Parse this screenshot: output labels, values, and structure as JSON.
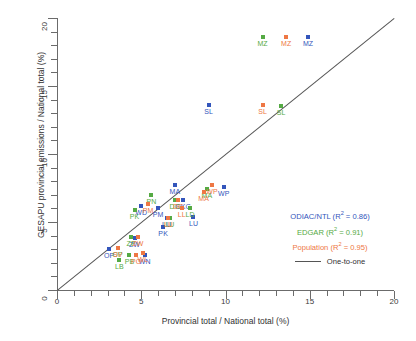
{
  "chart_data": {
    "type": "scatter",
    "title": "",
    "xlabel": "Provincial total / National total (%)",
    "ylabel": "GESAPU provincial emissions / National total (%)",
    "xlim": [
      0,
      20
    ],
    "ylim": [
      0,
      20
    ],
    "xticks_major": [
      0,
      5,
      10,
      15,
      20
    ],
    "yticks_major": [
      0,
      5,
      10,
      15,
      20
    ],
    "xtick_step": 1,
    "ytick_step": 1,
    "grid": false,
    "legend_position": "inside-lower-right",
    "colors": {
      "odiac": "#3355bb",
      "edgar": "#55aa44",
      "population": "#ee7744",
      "one_to_one": "#555555",
      "axis": "#6b6b6b"
    },
    "series": [
      {
        "name": "ODIAC/NTL",
        "color": "#3355bb",
        "r2": "0.86",
        "legend_label": "ODIAC/NTL (R",
        "points": [
          {
            "label": "MZ",
            "x": 14.9,
            "y": 18.6
          },
          {
            "label": "SL",
            "x": 9.0,
            "y": 13.6
          },
          {
            "label": "WP",
            "x": 9.9,
            "y": 7.6
          },
          {
            "label": "MA",
            "x": 7.0,
            "y": 7.7
          },
          {
            "label": "DKG",
            "x": 7.5,
            "y": 6.6
          },
          {
            "label": "LU",
            "x": 8.1,
            "y": 5.4
          },
          {
            "label": "PM",
            "x": 6.0,
            "y": 6.0
          },
          {
            "label": "LU",
            "x": 6.5,
            "y": 5.3
          },
          {
            "label": "PK",
            "x": 6.3,
            "y": 4.6
          },
          {
            "label": "WD",
            "x": 5.0,
            "y": 6.2
          },
          {
            "label": "ZW",
            "x": 4.6,
            "y": 3.8
          },
          {
            "label": "WN",
            "x": 5.2,
            "y": 2.6
          },
          {
            "label": "OP",
            "x": 3.1,
            "y": 3.0
          }
        ]
      },
      {
        "name": "EDGAR",
        "color": "#55aa44",
        "r2": "0.91",
        "legend_label": "EDGAR (R",
        "points": [
          {
            "label": "MZ",
            "x": 12.2,
            "y": 18.6
          },
          {
            "label": "SL",
            "x": 13.3,
            "y": 13.5
          },
          {
            "label": "MA",
            "x": 8.9,
            "y": 7.4
          },
          {
            "label": "DG",
            "x": 7.0,
            "y": 6.6
          },
          {
            "label": "LD",
            "x": 7.9,
            "y": 6.0
          },
          {
            "label": "PN",
            "x": 5.6,
            "y": 7.0
          },
          {
            "label": "PK",
            "x": 4.6,
            "y": 5.9
          },
          {
            "label": "LU",
            "x": 6.7,
            "y": 5.3
          },
          {
            "label": "ZP",
            "x": 4.4,
            "y": 3.9
          },
          {
            "label": "OP",
            "x": 3.6,
            "y": 3.1
          },
          {
            "label": "PB",
            "x": 4.3,
            "y": 2.6
          },
          {
            "label": "LB",
            "x": 3.7,
            "y": 2.2
          }
        ]
      },
      {
        "name": "Population",
        "color": "#ee7744",
        "r2": "0.95",
        "legend_label": "Population (R",
        "points": [
          {
            "label": "MZ",
            "x": 13.6,
            "y": 18.6
          },
          {
            "label": "SL",
            "x": 12.2,
            "y": 13.6
          },
          {
            "label": "WP",
            "x": 9.2,
            "y": 7.7
          },
          {
            "label": "MA",
            "x": 8.7,
            "y": 7.2
          },
          {
            "label": "DG",
            "x": 7.2,
            "y": 6.6
          },
          {
            "label": "LL",
            "x": 7.4,
            "y": 6.0
          },
          {
            "label": "LU",
            "x": 6.6,
            "y": 5.3
          },
          {
            "label": "PM",
            "x": 5.4,
            "y": 6.3
          },
          {
            "label": "ZW",
            "x": 4.8,
            "y": 3.9
          },
          {
            "label": "SV",
            "x": 3.6,
            "y": 3.1
          },
          {
            "label": "PO",
            "x": 4.7,
            "y": 2.6
          },
          {
            "label": "WL",
            "x": 5.1,
            "y": 2.7
          }
        ]
      }
    ],
    "reference_line": {
      "label": "One-to-one",
      "from": [
        0,
        0
      ],
      "to": [
        20,
        20
      ]
    }
  },
  "legend": {
    "r2_symbol": "R",
    "sup": "2",
    "items": [
      {
        "text_prefix": "ODIAC/NTL (R",
        "text_suffix": " = 0.86)"
      },
      {
        "text_prefix": "EDGAR (R",
        "text_suffix": " = 0.91)"
      },
      {
        "text_prefix": "Population (R",
        "text_suffix": " = 0.95)"
      }
    ],
    "line_label": "One-to-one"
  }
}
